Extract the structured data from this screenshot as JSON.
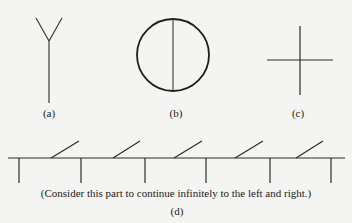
{
  "figures": [
    {
      "id": "a",
      "label": "(a)",
      "shape": "Y-shaped tree: vertical stem with two branches at top"
    },
    {
      "id": "b",
      "label": "(b)",
      "shape": "Circle with a vertical diameter"
    },
    {
      "id": "c",
      "label": "(c)",
      "shape": "Cross (plus sign)"
    },
    {
      "id": "d",
      "label": "(d)",
      "shape": "Infinite horizontal line with alternating downward vertical ticks and upward slanted segments",
      "caption": "(Consider this part to continue infinitely to the left and right.)"
    }
  ],
  "colors": {
    "background": "#f4f4f2",
    "stroke": "#2a2a2a",
    "text": "#1a1a1a"
  }
}
